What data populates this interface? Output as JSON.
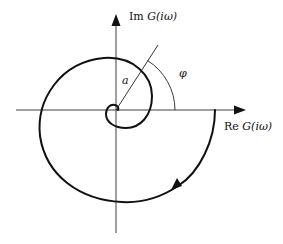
{
  "figure": {
    "type": "nyquist-spiral-diagram",
    "axes": {
      "x_label_prefix": "Re",
      "x_label_func": "G(iω)",
      "y_label_prefix": "Im",
      "y_label_func": "G(iω)"
    },
    "annotations": {
      "radius_label": "a",
      "angle_label": "φ"
    },
    "curve": {
      "description": "Spiral curve starting on positive real axis, winding clockwise inward toward the origin",
      "direction": "clockwise (arrow pointing down-left on lower right arc)"
    },
    "colors": {
      "background": "#ffffff",
      "stroke": "#111111"
    }
  }
}
